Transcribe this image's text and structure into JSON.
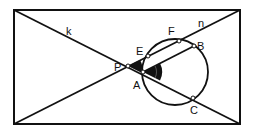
{
  "diagram": {
    "type": "geometry-circle-secants",
    "colors": {
      "stroke": "#111111",
      "background": "#ffffff",
      "angle_fill": "#111111"
    },
    "frame": {
      "x1": 14,
      "y1": 10,
      "x2": 240,
      "y2": 124
    },
    "circle": {
      "cx": 175,
      "cy": 72,
      "r": 33
    },
    "lines": {
      "k": {
        "label": "k",
        "from": [
          14,
          10
        ],
        "to": [
          240,
          124
        ]
      },
      "n": {
        "label": "n",
        "from": [
          14,
          124
        ],
        "to": [
          240,
          10
        ]
      },
      "AB": {
        "from": [
          143,
          72
        ],
        "to": [
          194,
          46
        ]
      }
    },
    "points": {
      "P": {
        "label": "P",
        "x": 128,
        "y": 66
      },
      "A": {
        "label": "A",
        "x": 143,
        "y": 72
      },
      "E": {
        "label": "E",
        "x": 148,
        "y": 56
      },
      "F": {
        "label": "F",
        "x": 179,
        "y": 41
      },
      "B": {
        "label": "B",
        "x": 194,
        "y": 46
      },
      "C": {
        "label": "C",
        "x": 193,
        "y": 98
      }
    },
    "labels": {
      "k": "k",
      "n": "n",
      "P": "P",
      "A": "A",
      "E": "E",
      "F": "F",
      "B": "B",
      "C": "C"
    }
  }
}
